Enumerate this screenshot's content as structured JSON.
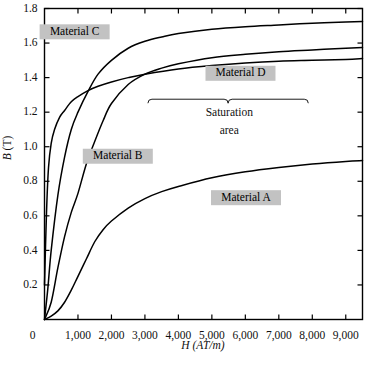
{
  "chart_data": {
    "type": "line",
    "title": "",
    "xlabel": "H (AT/m)",
    "ylabel": "B (T)",
    "xlim": [
      0,
      9500
    ],
    "ylim": [
      0,
      1.8
    ],
    "grid": false,
    "legend_position": "inline-labels",
    "xticks": [
      0,
      1000,
      2000,
      3000,
      4000,
      5000,
      6000,
      7000,
      8000,
      9000
    ],
    "xtick_labels": [
      "0",
      "1,000",
      "2,000",
      "3,000",
      "4,000",
      "5,000",
      "6,000",
      "7,000",
      "8,000",
      "9,000"
    ],
    "yticks": [
      0.2,
      0.4,
      0.6,
      0.8,
      1.0,
      1.2,
      1.4,
      1.6,
      1.8
    ],
    "ytick_labels": [
      "0.2",
      "0.4",
      "0.6",
      "0.8",
      "1.0",
      "1.2",
      "1.4",
      "1.6",
      "1.8"
    ],
    "series": [
      {
        "name": "Material A",
        "x": [
          0,
          200,
          400,
          600,
          800,
          1000,
          1250,
          1500,
          1750,
          2000,
          2500,
          3000,
          3500,
          4000,
          5000,
          6000,
          7000,
          8000,
          9000,
          9500
        ],
        "values": [
          0.0,
          0.02,
          0.05,
          0.1,
          0.17,
          0.25,
          0.35,
          0.45,
          0.52,
          0.57,
          0.645,
          0.7,
          0.74,
          0.77,
          0.82,
          0.855,
          0.88,
          0.9,
          0.915,
          0.92
        ]
      },
      {
        "name": "Material B",
        "x": [
          0,
          200,
          400,
          600,
          800,
          1000,
          1250,
          1500,
          1750,
          2000,
          2500,
          3000,
          3500,
          4000,
          5000,
          6000,
          7000,
          8000,
          9000,
          9500
        ],
        "values": [
          0.0,
          0.1,
          0.3,
          0.48,
          0.62,
          0.73,
          0.9,
          1.03,
          1.15,
          1.25,
          1.36,
          1.42,
          1.455,
          1.48,
          1.515,
          1.535,
          1.55,
          1.56,
          1.57,
          1.575
        ]
      },
      {
        "name": "Material C",
        "x": [
          0,
          100,
          200,
          400,
          600,
          800,
          1000,
          1300,
          1600,
          2000,
          2500,
          3000,
          3500,
          4000,
          5000,
          6000,
          7000,
          8000,
          9000,
          9500
        ],
        "values": [
          0.0,
          0.18,
          0.4,
          0.72,
          0.94,
          1.1,
          1.2,
          1.32,
          1.42,
          1.5,
          1.57,
          1.61,
          1.635,
          1.655,
          1.68,
          1.695,
          1.705,
          1.715,
          1.722,
          1.725
        ]
      },
      {
        "name": "Material D",
        "x": [
          0,
          60,
          120,
          200,
          300,
          450,
          600,
          800,
          1000,
          1300,
          1600,
          2000,
          2500,
          3000,
          4000,
          5000,
          6000,
          7000,
          8000,
          9000,
          9500
        ],
        "values": [
          0.2,
          0.62,
          0.88,
          1.02,
          1.1,
          1.17,
          1.21,
          1.26,
          1.29,
          1.325,
          1.35,
          1.375,
          1.4,
          1.42,
          1.45,
          1.47,
          1.485,
          1.495,
          1.5,
          1.505,
          1.51
        ]
      }
    ],
    "series_labels": [
      {
        "text": "Material C",
        "x": 900,
        "y": 1.665
      },
      {
        "text": "Material B",
        "x": 2190,
        "y": 0.945
      },
      {
        "text": "Material D",
        "x": 5855,
        "y": 1.425
      },
      {
        "text": "Material A",
        "x": 6020,
        "y": 0.705
      }
    ],
    "annotations": [
      {
        "text_line_1": "Saturation",
        "text_line_2": "area",
        "brace_x_start": 3090,
        "brace_x_end": 7880,
        "brace_y": 1.275,
        "text_x": 5520,
        "text_y_line_1": 1.175,
        "text_y_line_2": 1.075
      }
    ],
    "colors": {
      "curve": "#000000",
      "axis": "#000000",
      "background": "#ffffff",
      "label_box": "#c2c2c2",
      "text": "#111111"
    }
  }
}
